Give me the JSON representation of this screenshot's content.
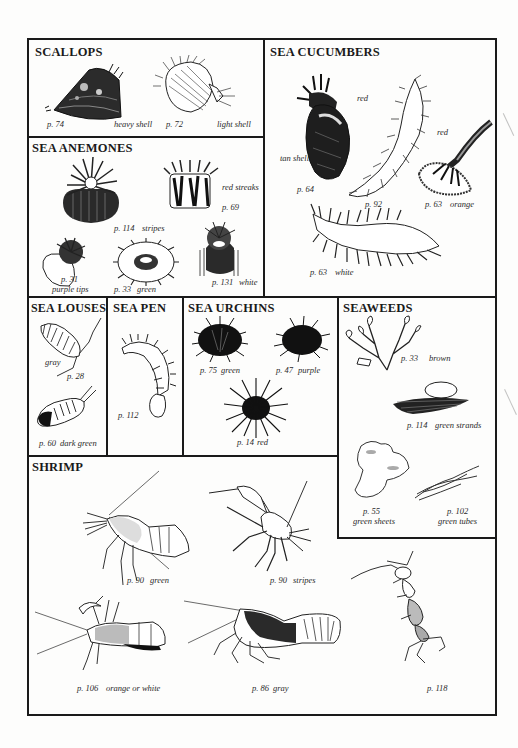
{
  "sections": {
    "scallops": {
      "title": "SCALLOPS",
      "items": [
        {
          "page": "p. 74",
          "note": "heavy shell"
        },
        {
          "page": "p. 72",
          "note": "light shell"
        }
      ]
    },
    "sea_cucumbers": {
      "title": "SEA CUCUMBERS",
      "items": [
        {
          "page": "p. 64",
          "notes": [
            "red",
            "tan shell"
          ]
        },
        {
          "page": "p. 92",
          "note": "red"
        },
        {
          "page": "p. 63",
          "note": "orange"
        },
        {
          "page": "p. 63",
          "note": "white"
        }
      ]
    },
    "sea_anemones": {
      "title": "SEA ANEMONES",
      "items": [
        {
          "page": "p. 114",
          "note": "stripes"
        },
        {
          "page": "p. 69",
          "note": "red streaks"
        },
        {
          "page": "p. 31",
          "note": "purple tips"
        },
        {
          "page": "p. 33",
          "note": "green"
        },
        {
          "page": "p. 131",
          "note": "white"
        }
      ]
    },
    "sea_louses": {
      "title": "SEA LOUSES",
      "items": [
        {
          "page": "p. 28",
          "note": "gray"
        },
        {
          "page": "p. 60",
          "note": "dark green"
        }
      ]
    },
    "sea_pen": {
      "title": "SEA PEN",
      "items": [
        {
          "page": "p. 112"
        }
      ]
    },
    "sea_urchins": {
      "title": "SEA URCHINS",
      "items": [
        {
          "page": "p. 75",
          "note": "green"
        },
        {
          "page": "p. 47",
          "note": "purple"
        },
        {
          "page": "p. 14",
          "note": "red"
        }
      ]
    },
    "seaweeds": {
      "title": "SEAWEEDS",
      "items": [
        {
          "page": "p. 33",
          "note": "brown"
        },
        {
          "page": "p. 114",
          "note": "green strands"
        },
        {
          "page": "p. 55",
          "note": "green sheets"
        },
        {
          "page": "p. 102",
          "note": "green tubes"
        }
      ]
    },
    "shrimp": {
      "title": "SHRIMP",
      "items": [
        {
          "page": "p. 90",
          "note": "green"
        },
        {
          "page": "p. 90",
          "note": "stripes"
        },
        {
          "page": "p. 106",
          "note": "orange or white"
        },
        {
          "page": "p. 86",
          "note": "gray"
        },
        {
          "page": "p. 118"
        }
      ]
    }
  }
}
